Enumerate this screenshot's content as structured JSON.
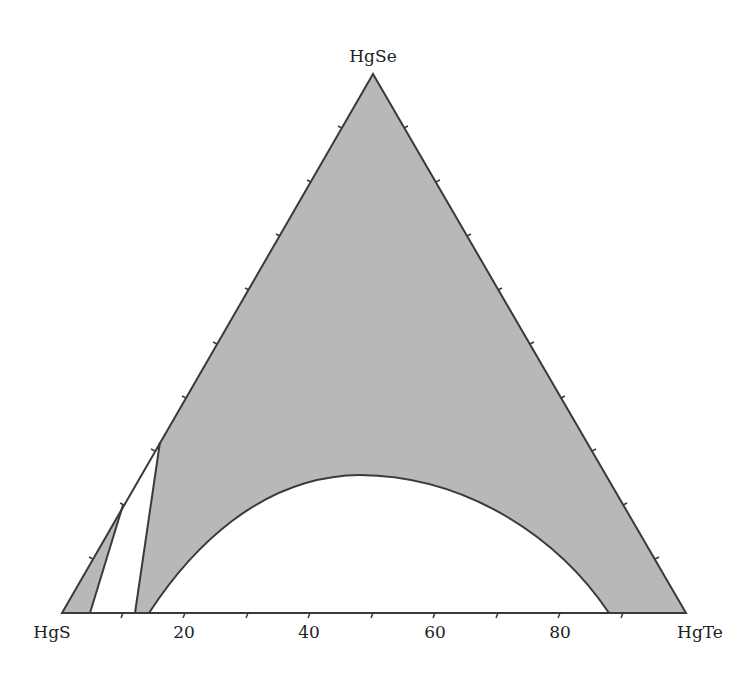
{
  "diagram": {
    "type": "ternary-phase-diagram",
    "vertices": {
      "top": "HgSe",
      "left": "HgS",
      "right": "HgTe"
    },
    "axis_ticks": [
      "20",
      "40",
      "60",
      "80"
    ],
    "colors": {
      "shaded": "#b8b8b8",
      "line": "#3a3a3a",
      "background": "#ffffff"
    },
    "regions": [
      {
        "name": "single-phase-region-main",
        "shaded": true
      },
      {
        "name": "single-phase-region-left-sliver",
        "shaded": true
      },
      {
        "name": "two-phase-gap-left",
        "shaded": false
      },
      {
        "name": "miscibility-gap-dome",
        "shaded": false
      }
    ]
  }
}
